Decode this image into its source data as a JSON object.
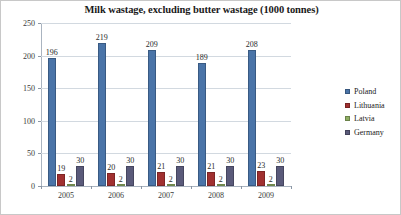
{
  "chart_data": {
    "type": "bar",
    "title": "Milk wastage, excluding butter wastage (1000 tonnes)",
    "xlabel": "",
    "ylabel": "",
    "ylim": [
      0,
      250
    ],
    "yticks": [
      0,
      50,
      100,
      150,
      200,
      250
    ],
    "grid": true,
    "legend_position": "right",
    "categories": [
      "2005",
      "2006",
      "2007",
      "2008",
      "2009"
    ],
    "series": [
      {
        "name": "Poland",
        "color": "#4a74a8",
        "values": [
          196,
          219,
          209,
          189,
          208
        ]
      },
      {
        "name": "Lithuania",
        "color": "#a03030",
        "values": [
          19,
          20,
          21,
          21,
          23
        ]
      },
      {
        "name": "Latvia",
        "color": "#8fae63",
        "values": [
          2,
          2,
          2,
          2,
          2
        ]
      },
      {
        "name": "Germany",
        "color": "#5a5a7a",
        "values": [
          30,
          30,
          30,
          30,
          30
        ]
      }
    ]
  }
}
